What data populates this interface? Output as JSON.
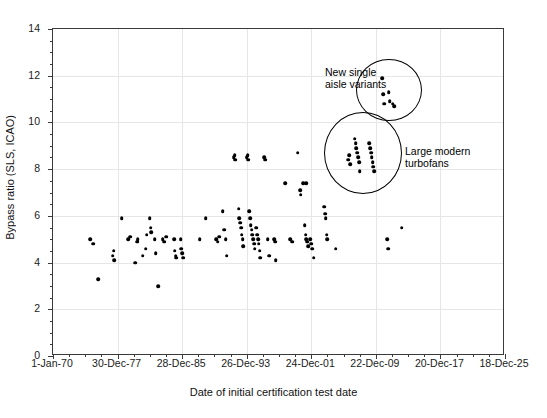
{
  "chart_data": {
    "type": "scatter",
    "title": "",
    "xlabel": "Date of initial certification test date",
    "ylabel": "Bypass ratio (SLS, ICAO)",
    "ylim": [
      0,
      14
    ],
    "yticks": [
      0,
      2,
      4,
      6,
      8,
      10,
      12,
      14
    ],
    "y_minor_step": 0.5,
    "xlim_labels": [
      "1-Jan-70",
      "18-Dec-25"
    ],
    "xticks": [
      "1-Jan-70",
      "30-Dec-77",
      "28-Dec-85",
      "26-Dec-93",
      "24-Dec-01",
      "22-Dec-09",
      "20-Dec-17",
      "18-Dec-25"
    ],
    "x_tick_years": [
      1970,
      1978,
      1986,
      1994,
      2002,
      2010,
      2018,
      2026
    ],
    "x_minor_divisions": 4,
    "grid": true,
    "legend": "none",
    "marker_color": "#000000",
    "points": [
      [
        1974.6,
        5.0
      ],
      [
        1975.0,
        4.8
      ],
      [
        1975.6,
        3.3
      ],
      [
        1977.4,
        4.3
      ],
      [
        1977.5,
        4.5
      ],
      [
        1977.6,
        4.1
      ],
      [
        1978.5,
        5.9
      ],
      [
        1979.3,
        5.0
      ],
      [
        1979.6,
        5.1
      ],
      [
        1980.2,
        4.0
      ],
      [
        1980.4,
        4.9
      ],
      [
        1980.5,
        5.0
      ],
      [
        1981.1,
        4.3
      ],
      [
        1981.5,
        4.6
      ],
      [
        1981.6,
        5.2
      ],
      [
        1982.0,
        5.9
      ],
      [
        1982.1,
        5.5
      ],
      [
        1982.2,
        5.3
      ],
      [
        1982.6,
        5.0
      ],
      [
        1982.7,
        4.4
      ],
      [
        1983.0,
        3.0
      ],
      [
        1983.6,
        5.0
      ],
      [
        1983.8,
        4.9
      ],
      [
        1984.0,
        5.1
      ],
      [
        1985.0,
        5.0
      ],
      [
        1985.1,
        4.5
      ],
      [
        1985.2,
        4.3
      ],
      [
        1985.3,
        4.2
      ],
      [
        1985.8,
        5.0
      ],
      [
        1985.9,
        4.6
      ],
      [
        1986.0,
        4.4
      ],
      [
        1986.1,
        4.2
      ],
      [
        1988.2,
        5.0
      ],
      [
        1988.9,
        5.9
      ],
      [
        1990.2,
        5.0
      ],
      [
        1990.4,
        4.9
      ],
      [
        1990.6,
        5.1
      ],
      [
        1991.0,
        6.2
      ],
      [
        1991.2,
        5.4
      ],
      [
        1991.4,
        5.0
      ],
      [
        1991.5,
        4.3
      ],
      [
        1992.4,
        8.5
      ],
      [
        1992.5,
        8.6
      ],
      [
        1992.6,
        8.4
      ],
      [
        1993.0,
        6.3
      ],
      [
        1993.1,
        5.9
      ],
      [
        1993.2,
        5.7
      ],
      [
        1993.3,
        5.5
      ],
      [
        1993.4,
        5.2
      ],
      [
        1993.5,
        5.0
      ],
      [
        1993.6,
        4.7
      ],
      [
        1994.0,
        8.5
      ],
      [
        1994.1,
        8.6
      ],
      [
        1994.2,
        8.4
      ],
      [
        1994.3,
        6.2
      ],
      [
        1994.4,
        5.9
      ],
      [
        1994.5,
        5.6
      ],
      [
        1994.6,
        5.4
      ],
      [
        1994.7,
        5.2
      ],
      [
        1994.8,
        5.0
      ],
      [
        1994.9,
        4.8
      ],
      [
        1995.0,
        4.6
      ],
      [
        1995.2,
        5.5
      ],
      [
        1995.3,
        5.2
      ],
      [
        1995.4,
        5.0
      ],
      [
        1995.5,
        4.8
      ],
      [
        1995.6,
        4.5
      ],
      [
        1995.7,
        4.2
      ],
      [
        1996.2,
        8.5
      ],
      [
        1996.3,
        8.4
      ],
      [
        1996.6,
        5.0
      ],
      [
        1996.8,
        4.3
      ],
      [
        1997.4,
        5.0
      ],
      [
        1997.5,
        4.9
      ],
      [
        1997.6,
        4.1
      ],
      [
        1998.8,
        7.4
      ],
      [
        1999.4,
        5.0
      ],
      [
        1999.6,
        4.9
      ],
      [
        2000.3,
        8.7
      ],
      [
        2000.6,
        7.1
      ],
      [
        2000.7,
        6.9
      ],
      [
        2001.0,
        7.4
      ],
      [
        2001.4,
        7.4
      ],
      [
        2001.2,
        5.6
      ],
      [
        2001.3,
        5.2
      ],
      [
        2001.4,
        5.0
      ],
      [
        2001.5,
        4.9
      ],
      [
        2001.6,
        4.7
      ],
      [
        2001.9,
        5.0
      ],
      [
        2002.0,
        4.8
      ],
      [
        2002.1,
        4.6
      ],
      [
        2002.3,
        4.2
      ],
      [
        2003.6,
        6.4
      ],
      [
        2003.7,
        6.1
      ],
      [
        2003.8,
        5.9
      ],
      [
        2003.9,
        5.2
      ],
      [
        2004.0,
        5.0
      ],
      [
        2005.0,
        4.6
      ],
      [
        2006.6,
        8.4
      ],
      [
        2006.7,
        8.6
      ],
      [
        2006.8,
        8.2
      ],
      [
        2007.4,
        9.3
      ],
      [
        2007.5,
        9.1
      ],
      [
        2007.6,
        8.9
      ],
      [
        2007.7,
        8.7
      ],
      [
        2007.8,
        8.5
      ],
      [
        2007.9,
        8.3
      ],
      [
        2008.0,
        7.9
      ],
      [
        2009.2,
        9.1
      ],
      [
        2009.3,
        8.9
      ],
      [
        2009.4,
        8.7
      ],
      [
        2009.5,
        8.5
      ],
      [
        2009.6,
        8.3
      ],
      [
        2009.7,
        8.1
      ],
      [
        2009.8,
        7.9
      ],
      [
        2010.8,
        11.9
      ],
      [
        2010.9,
        11.2
      ],
      [
        2011.0,
        10.8
      ],
      [
        2011.6,
        11.3
      ],
      [
        2011.7,
        10.9
      ],
      [
        2012.1,
        10.8
      ],
      [
        2012.3,
        10.7
      ],
      [
        2011.4,
        5.0
      ],
      [
        2011.5,
        4.6
      ],
      [
        2013.2,
        5.5
      ]
    ],
    "annotations": [
      {
        "name": "new-single-aisle-variants",
        "text": "New single\naisle variants",
        "circle": {
          "cx_year": 2011.6,
          "cy": 11.4,
          "rx_px": 32,
          "ry_px": 30
        }
      },
      {
        "name": "large-modern-turbofans",
        "text": "Large modern\nturbofans",
        "circle": {
          "cx_year": 2008.4,
          "cy": 8.7,
          "rx_px": 38,
          "ry_px": 40
        }
      }
    ]
  },
  "axes": {
    "x_title": "Date of initial certification test date",
    "y_title": "Bypass ratio (SLS, ICAO)",
    "x_tick_labels": [
      "1-Jan-70",
      "30-Dec-77",
      "28-Dec-85",
      "26-Dec-93",
      "24-Dec-01",
      "22-Dec-09",
      "20-Dec-17",
      "18-Dec-25"
    ],
    "y_tick_labels": [
      "0",
      "2",
      "4",
      "6",
      "8",
      "10",
      "12",
      "14"
    ]
  },
  "annotation_labels": {
    "upper_line1": "New single",
    "upper_line2": "aisle variants",
    "lower_line1": "Large modern",
    "lower_line2": "turbofans"
  },
  "colors": {
    "marker": "#000000",
    "grid": "#e6e6e6",
    "axis": "#3a3a3a",
    "text": "#111111",
    "background": "#ffffff"
  }
}
